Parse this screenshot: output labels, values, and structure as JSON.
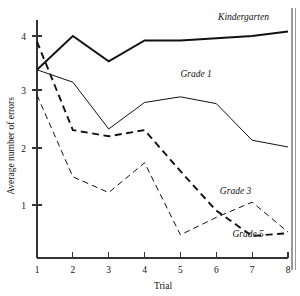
{
  "chart_data": {
    "type": "line",
    "title": "",
    "xlabel": "Trial",
    "ylabel": "Average number of errors",
    "x": [
      1,
      2,
      3,
      4,
      5,
      6,
      7,
      8
    ],
    "xticklabels": [
      "1",
      "2",
      "3",
      "4",
      "5",
      "6",
      "7",
      "8"
    ],
    "yticklabels": [
      "1",
      "2",
      "3",
      "4"
    ],
    "yticks": [
      1,
      2,
      3,
      4
    ],
    "xlim": [
      1,
      8
    ],
    "ylim": [
      0.3,
      4.35
    ],
    "grid": false,
    "legend_position": "inline-annotations",
    "series": [
      {
        "name": "Kindergarten",
        "style": "solid-thick",
        "color": "#111111",
        "values": [
          3.4,
          4.0,
          3.55,
          3.92,
          3.92,
          3.96,
          4.0,
          4.08
        ],
        "label_x": 6.05,
        "label_y": 4.28
      },
      {
        "name": "Grade 1",
        "style": "solid-thin",
        "color": "#111111",
        "values": [
          3.4,
          3.18,
          2.35,
          2.82,
          2.92,
          2.8,
          2.15,
          2.03
        ],
        "label_x": 5.0,
        "label_y": 3.27
      },
      {
        "name": "Grade 3",
        "style": "dashed-thick",
        "color": "#111111",
        "values": [
          3.9,
          2.33,
          2.22,
          2.33,
          1.6,
          0.9,
          0.45,
          0.5
        ],
        "label_x": 6.1,
        "label_y": 1.2
      },
      {
        "name": "Grade 5",
        "style": "dashed-thin",
        "color": "#111111",
        "values": [
          2.95,
          1.5,
          1.22,
          1.75,
          0.47,
          0.78,
          1.05,
          0.52
        ],
        "label_x": 6.45,
        "label_y": 0.44
      }
    ]
  },
  "axes": {
    "y_title": "Average number of errors",
    "x_title": "Trial"
  }
}
